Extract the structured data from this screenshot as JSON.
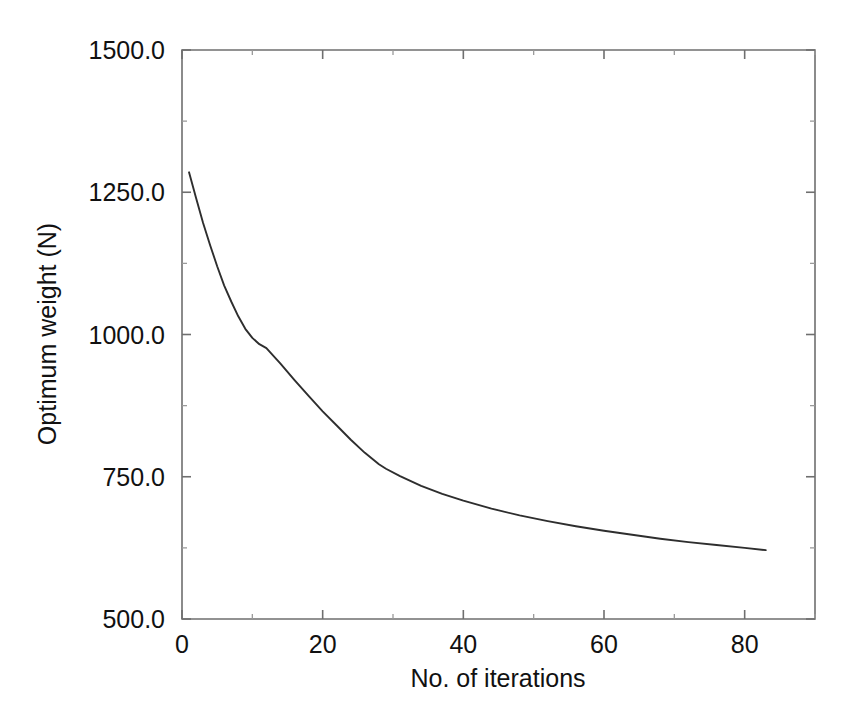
{
  "chart_data": {
    "type": "line",
    "title": "",
    "xlabel": "No. of iterations",
    "ylabel": "Optimum weight (N)",
    "xlim": [
      0,
      90
    ],
    "ylim": [
      500,
      1500
    ],
    "grid": false,
    "legend": false,
    "line_color": "#2e2e2e",
    "background_color": "#ffffff",
    "axis_color": "#6f6f6f",
    "x_ticks": [
      0,
      20,
      40,
      60,
      80
    ],
    "x_tick_labels": [
      "0",
      "20",
      "40",
      "60",
      "80"
    ],
    "x_minor_ticks": [
      10,
      30,
      50,
      70,
      90
    ],
    "y_ticks": [
      500,
      750,
      1000,
      1250,
      1500
    ],
    "y_tick_labels": [
      "500.0",
      "750.0",
      "1000.0",
      "1250.0",
      "1500.0"
    ],
    "y_minor_ticks": [
      625,
      875,
      1125,
      1375
    ],
    "series": [
      {
        "name": "Optimum weight",
        "x": [
          1,
          2,
          3,
          4,
          5,
          6,
          7,
          8,
          9,
          10,
          11,
          12,
          14,
          16,
          18,
          20,
          22,
          24,
          26,
          28,
          29,
          31,
          34,
          37,
          40,
          44,
          48,
          52,
          56,
          60,
          64,
          68,
          72,
          76,
          80,
          83
        ],
        "y": [
          1285,
          1240,
          1196,
          1157,
          1120,
          1086,
          1058,
          1032,
          1010,
          994,
          983,
          976,
          949,
          920,
          892,
          865,
          840,
          815,
          792,
          772,
          764,
          751,
          734,
          720,
          708,
          694,
          682,
          672,
          663,
          655,
          648,
          641,
          635,
          630,
          625,
          621
        ]
      }
    ],
    "annotations": []
  },
  "figure": {
    "plot_area_px": {
      "left": 182,
      "top": 50,
      "right": 815,
      "bottom": 619
    }
  }
}
